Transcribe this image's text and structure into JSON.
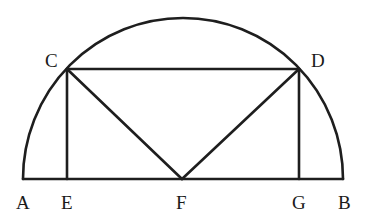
{
  "diagram": {
    "type": "geometry",
    "colors": {
      "stroke": "#1e1e1e",
      "background": "#ffffff",
      "text": "#1a1a1a"
    },
    "points": {
      "A": {
        "label": "A",
        "x": 23,
        "y": 179
      },
      "E": {
        "label": "E",
        "x": 67,
        "y": 179
      },
      "F": {
        "label": "F",
        "x": 182,
        "y": 179
      },
      "G": {
        "label": "G",
        "x": 299,
        "y": 179
      },
      "B": {
        "label": "B",
        "x": 343,
        "y": 179
      },
      "C": {
        "label": "C",
        "x": 67,
        "y": 69
      },
      "D": {
        "label": "D",
        "x": 299,
        "y": 69
      }
    },
    "segments": [
      "AB",
      "CD",
      "CE",
      "DG",
      "CF",
      "DF"
    ],
    "arcs": [
      "semicircle AB through C and D"
    ]
  }
}
